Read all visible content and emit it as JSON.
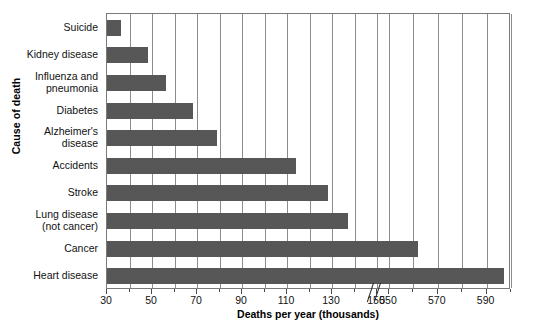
{
  "chart_data": {
    "type": "bar",
    "orientation": "horizontal",
    "title": "",
    "xlabel": "Deaths per year (thousands)",
    "ylabel": "Cause of death",
    "categories": [
      "Suicide",
      "Kidney disease",
      "Influenza and pneumonia",
      "Diabetes",
      "Alzheimer's disease",
      "Accidents",
      "Stroke",
      "Lung disease (not cancer)",
      "Cancer",
      "Heart disease"
    ],
    "values": [
      36,
      48,
      56,
      68,
      79,
      114,
      128,
      137,
      562,
      597
    ],
    "units": "thousands of deaths per year",
    "xlim": [
      30,
      600
    ],
    "axis_break": {
      "present": true,
      "between": [
        150,
        550
      ]
    },
    "xticks_major": [
      30,
      50,
      70,
      90,
      110,
      130,
      150,
      550,
      570,
      590
    ],
    "xtick_labels": [
      "30",
      "50",
      "70",
      "90",
      "110",
      "130",
      "150",
      "550",
      "570",
      "590"
    ],
    "xticks_minor": [
      40,
      60,
      80,
      100,
      120,
      140,
      560,
      580,
      600
    ],
    "grid": "vertical",
    "legend": "none",
    "bar_color": "#575757",
    "plot_border_color": "#7a7a7a",
    "gridline_color": "#8c8c8c",
    "background_color": "#ffffff"
  },
  "category_labels": [
    {
      "lines": [
        "Suicide"
      ]
    },
    {
      "lines": [
        "Kidney disease"
      ]
    },
    {
      "lines": [
        "Influenza and",
        "pneumonia"
      ]
    },
    {
      "lines": [
        "Diabetes"
      ]
    },
    {
      "lines": [
        "Alzheimer's",
        "disease"
      ]
    },
    {
      "lines": [
        "Accidents"
      ]
    },
    {
      "lines": [
        "Stroke"
      ]
    },
    {
      "lines": [
        "Lung disease",
        "(not cancer)"
      ]
    },
    {
      "lines": [
        "Cancer"
      ]
    },
    {
      "lines": [
        "Heart disease"
      ]
    }
  ],
  "axes": {
    "x_title": "Deaths per year (thousands)",
    "y_title": "Cause of death"
  },
  "credit": {
    "text": "© Cengage Learning 2013"
  }
}
